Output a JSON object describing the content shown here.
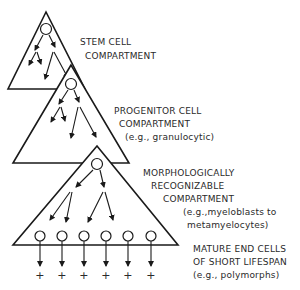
{
  "diagram": {
    "compartments": [
      {
        "id": "stem",
        "label_lines": [
          "STEM CELL",
          "COMPARTMENT"
        ]
      },
      {
        "id": "progenitor",
        "label_lines": [
          "PROGENITOR  CELL",
          "COMPARTMENT",
          "(e.g., granulocytic)"
        ]
      },
      {
        "id": "recognizable",
        "label_lines": [
          "MORPHOLOGICALLY",
          "RECOGNIZABLE",
          "COMPARTMENT",
          "(e.g.,myeloblasts to",
          "metamyelocytes)"
        ]
      },
      {
        "id": "mature",
        "label_lines": [
          "MATURE END CELLS",
          "OF SHORT LIFESPAN",
          "(e.g., polymorphs)"
        ]
      }
    ],
    "mature_cell_count": 6,
    "death_symbol": "+",
    "colors": {
      "line": "#1a1a1a",
      "text": "#2a2a2a",
      "background": "#ffffff"
    }
  }
}
